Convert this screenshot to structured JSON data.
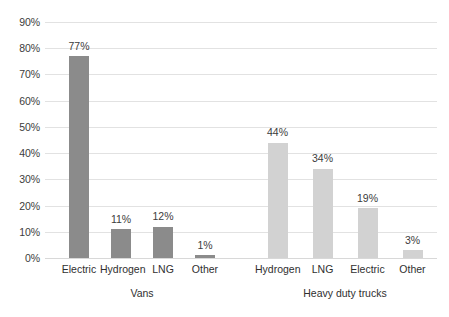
{
  "chart_data": {
    "type": "bar",
    "title": "",
    "subtitle": "",
    "xlabel": "",
    "ylabel": "",
    "ylim": [
      0,
      90
    ],
    "ytick_labels": [
      "90%",
      "80%",
      "70%",
      "60%",
      "50%",
      "40%",
      "30%",
      "20%",
      "10%",
      "0%"
    ],
    "ytick_values": [
      90,
      80,
      70,
      60,
      50,
      40,
      30,
      20,
      10,
      0
    ],
    "grid": "horizontal",
    "legend": "none",
    "value_label_suffix": "%",
    "groups": [
      {
        "name": "Vans",
        "color": "#8b8b8b",
        "categories": [
          "Electric",
          "Hydrogen",
          "LNG",
          "Other"
        ],
        "values": [
          77,
          11,
          12,
          1
        ],
        "value_labels": [
          "77%",
          "11%",
          "12%",
          "1%"
        ]
      },
      {
        "name": "Heavy duty trucks",
        "color": "#d2d2d2",
        "categories": [
          "Hydrogen",
          "LNG",
          "Electric",
          "Other"
        ],
        "values": [
          44,
          34,
          19,
          3
        ],
        "value_labels": [
          "44%",
          "34%",
          "19%",
          "3%"
        ]
      }
    ]
  },
  "colors": {
    "vans_bar": "#8b8b8b",
    "trucks_bar": "#d2d2d2",
    "gridline": "#e2e2e2",
    "baseline": "#d8d8d8",
    "text": "#3c3c3c",
    "background": "#ffffff"
  }
}
